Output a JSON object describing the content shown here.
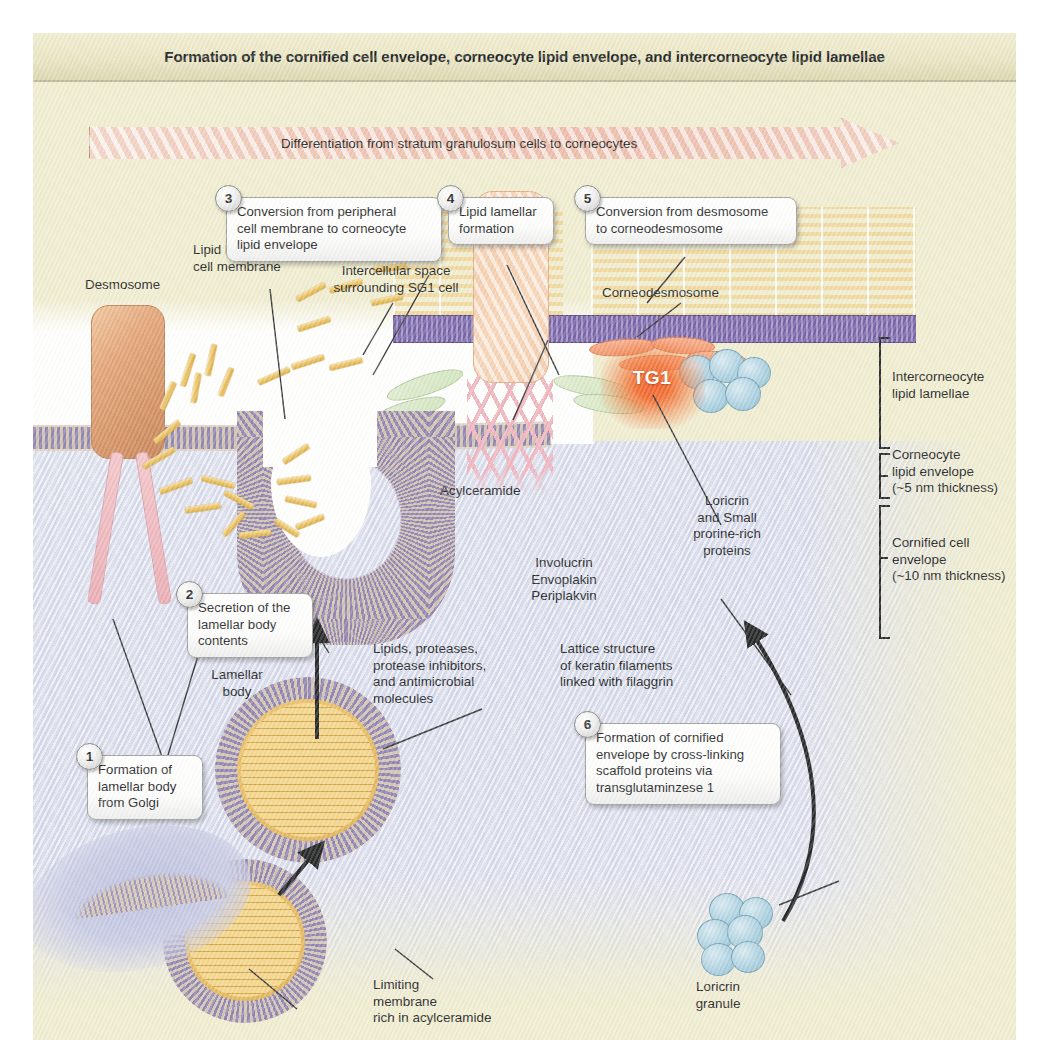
{
  "figure": {
    "title": "Formation of the cornified cell envelope, corneocyte lipid envelope, and intercorneocyte lipid lamellae",
    "arrow_label": "Differentiation from stratum granulosum cells to corneocytes"
  },
  "steps": [
    {
      "number": "1",
      "text": "Formation of\nlamellar body\nfrom Golgi"
    },
    {
      "number": "2",
      "text": "Secretion of the\nlamellar body\ncontents"
    },
    {
      "number": "3",
      "text": "Conversion from peripheral\ncell membrane to corneocyte\nlipid envelope"
    },
    {
      "number": "4",
      "text": "Lipid lamellar\nformation"
    },
    {
      "number": "5",
      "text": "Conversion from desmosome\nto corneodesmosome"
    },
    {
      "number": "6",
      "text": "Formation of cornified\nenvelope by cross-linking\nscaffold proteins via\ntransglutaminzese 1"
    }
  ],
  "labels": {
    "desmosome": "Desmosome",
    "lipid_bilayer": "Lipid bilayer\ncell membrane",
    "intercellular_space": "Intercellular space\nsurrounding SG1 cell",
    "corneodesmosome": "Corneodesmosome",
    "acylceramide": "Acylceramide",
    "involucrin_group": "Involucrin\nEnvoplakin\nPeriplakvin",
    "keratin_filaments": "Keratin\nfilaments",
    "lamellar_body": "Lamellar\nbody",
    "lipids_contents": "Lipids, proteases,\nprotease inhibitors,\nand antimicrobial\nmolecules",
    "limiting_membrane": "Limiting\nmembrane\nrich in acylceramide",
    "lattice_structure": "Lattice structure\nof keratin filaments\nlinked with filaggrin",
    "tg1": "TG1",
    "loricrin_sprr": "Loricrin\nand Small\nprorine-rich\nproteins",
    "loricrin_granule": "Loricrin\ngranule"
  },
  "brackets": [
    {
      "text": "Intercorneocyte\nlipid lamellae"
    },
    {
      "text": "Corneocyte\nlipid envelope\n(~5 nm thickness)"
    },
    {
      "text": "Cornified cell\nenvelope\n(~10 nm thickness)"
    }
  ],
  "colors": {
    "paper": "#efeccf",
    "cytoplasm": "#dfe2f0",
    "membrane_purple": "#8b7fb0",
    "lipid_gold": "#e9bf5c",
    "desmosome_orange": "#d18c5d",
    "corneocyte_peach": "#f6d2b4",
    "keratin_pink": "#e9a9b2",
    "tg1_red": "#f2551d",
    "loricrin_blue": "#a9cfe0",
    "involucrin_green": "#cfe3bd",
    "arrow_band": "#f2cfc2"
  }
}
